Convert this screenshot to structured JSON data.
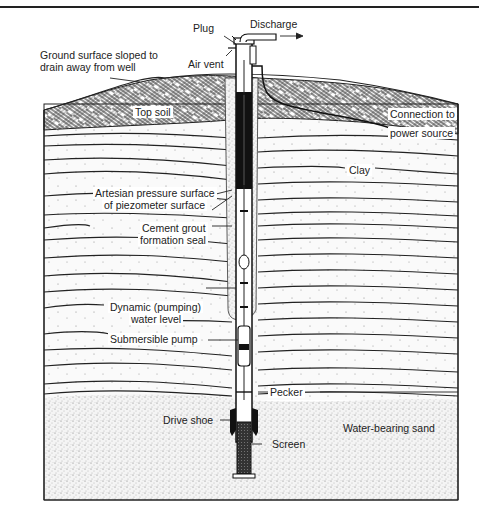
{
  "figure": {
    "type": "cross-section"
  },
  "labels": {
    "plug": "Plug",
    "discharge": "Discharge",
    "ground_surface_1": "Ground surface sloped to",
    "ground_surface_2": "drain away from well",
    "air_vent": "Air vent",
    "top_soil": "Top soil",
    "connection_1": "Connection to",
    "connection_2": "power source",
    "clay": "Clay",
    "artesian_1": "Artesian pressure surface",
    "artesian_2": "of piezometer surface",
    "cement_1": "Cement grout",
    "cement_2": "formation seal",
    "dynamic_1": "Dynamic (pumping)",
    "dynamic_2": "water level",
    "submersible_pump": "Submersible pump",
    "pecker": "Pecker",
    "drive_shoe": "Drive shoe",
    "screen": "Screen",
    "water_bearing_sand": "Water-bearing sand"
  },
  "colors": {
    "ink": "#1a1a1a",
    "paper": "#ffffff",
    "casing_dark": "#111111",
    "sand_dot": "#555555"
  }
}
